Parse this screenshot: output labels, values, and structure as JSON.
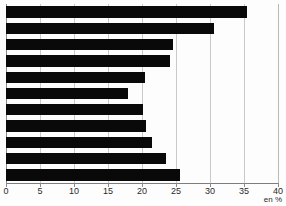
{
  "chart_data": {
    "type": "bar",
    "orientation": "horizontal",
    "title": "",
    "subtitle": "",
    "xlabel": "en %",
    "ylabel": "",
    "unit_label": "en %",
    "xlim": [
      0,
      40
    ],
    "xticks": [
      0,
      5,
      10,
      15,
      20,
      25,
      30,
      35,
      40
    ],
    "xtick_labels": [
      "0",
      "5",
      "10",
      "15",
      "20",
      "25",
      "30",
      "35",
      "40"
    ],
    "grid": true,
    "grid_axis": "x",
    "legend": null,
    "legend_position": "none",
    "bar_color": "#090909",
    "grid_color": "#c9c9c9",
    "axis_color": "#8a8a8a",
    "background_color": "#fdfdfd",
    "categories": [
      "",
      "",
      "",
      "",
      "",
      "",
      "",
      "",
      "",
      "",
      ""
    ],
    "values": [
      35.4,
      30.6,
      24.6,
      24.1,
      20.4,
      17.9,
      20.1,
      20.6,
      21.5,
      23.5,
      25.6
    ],
    "bars": [
      {
        "index": 1,
        "label": "",
        "value": 35.4
      },
      {
        "index": 2,
        "label": "",
        "value": 30.6
      },
      {
        "index": 3,
        "label": "",
        "value": 24.6
      },
      {
        "index": 4,
        "label": "",
        "value": 24.1
      },
      {
        "index": 5,
        "label": "",
        "value": 20.4
      },
      {
        "index": 6,
        "label": "",
        "value": 17.9
      },
      {
        "index": 7,
        "label": "",
        "value": 20.1
      },
      {
        "index": 8,
        "label": "",
        "value": 20.6
      },
      {
        "index": 9,
        "label": "",
        "value": 21.5
      },
      {
        "index": 10,
        "label": "",
        "value": 23.5
      },
      {
        "index": 11,
        "label": "",
        "value": 25.6
      }
    ]
  }
}
